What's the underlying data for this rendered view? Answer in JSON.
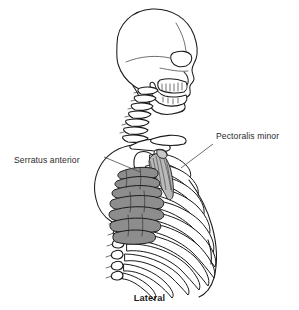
{
  "figure": {
    "caption": "Lateral",
    "background_color": "#ffffff",
    "line_color": "#1a1a1a",
    "text_color": "#2b2b2b",
    "view": "Lateral"
  },
  "labels": [
    {
      "id": "serratus-anterior",
      "text": "Serratus anterior",
      "side": "left",
      "x": 14,
      "y": 160,
      "leader_from": [
        104,
        157
      ],
      "leader_to": [
        140,
        172
      ],
      "fill_color": "#8d8d8d",
      "outline_color": "#141414"
    },
    {
      "id": "pectoralis-minor",
      "text": "Pectoralis minor",
      "side": "right",
      "x": 216,
      "y": 140,
      "leader_from": [
        213,
        144
      ],
      "leader_to": [
        181,
        168
      ],
      "fill_color": "#b9b9b9",
      "outline_color": "#2a2a2a"
    }
  ],
  "structures": [
    {
      "id": "skull",
      "name": "Skull",
      "shaded": false
    },
    {
      "id": "mandible",
      "name": "Mandible",
      "shaded": false
    },
    {
      "id": "teeth",
      "name": "Teeth",
      "shaded": false
    },
    {
      "id": "orbit",
      "name": "Orbit",
      "shaded": false
    },
    {
      "id": "cervical-spine",
      "name": "Cervical vertebrae",
      "count": 7,
      "shaded": false
    },
    {
      "id": "thoracic-spine",
      "name": "Thoracic vertebrae",
      "count": 12,
      "shaded": false
    },
    {
      "id": "scapula",
      "name": "Scapula",
      "shaded": false
    },
    {
      "id": "clavicle",
      "name": "Clavicle",
      "shaded": false
    },
    {
      "id": "humerus-head",
      "name": "Head of humerus",
      "shaded": false
    },
    {
      "id": "rib-cage",
      "name": "Rib cage",
      "count": 12,
      "shaded": false
    },
    {
      "id": "serratus-anterior-muscle",
      "name": "Serratus anterior",
      "digitations": 7,
      "shaded": true,
      "shade": "#8d8d8d"
    },
    {
      "id": "pectoralis-minor-muscle",
      "name": "Pectoralis minor",
      "shaded": true,
      "shade": "#b9b9b9"
    }
  ]
}
